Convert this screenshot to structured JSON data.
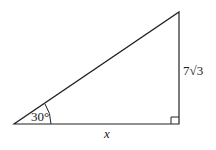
{
  "diagram": {
    "type": "right-triangle",
    "angle_label": "30°",
    "vertical_side_label": "7√3",
    "base_label": "x",
    "stroke_color": "#222222",
    "background": "#ffffff"
  }
}
